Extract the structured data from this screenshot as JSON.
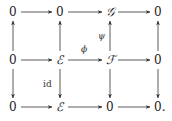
{
  "diagram": {
    "nodes": [
      {
        "id": "r1c1",
        "text": "0",
        "row": 0,
        "col": 0
      },
      {
        "id": "r1c2",
        "text": "0",
        "row": 0,
        "col": 1
      },
      {
        "id": "r1c3",
        "text": "𝒢",
        "row": 0,
        "col": 2
      },
      {
        "id": "r1c4",
        "text": "0",
        "row": 0,
        "col": 3
      },
      {
        "id": "r2c1",
        "text": "0",
        "row": 1,
        "col": 0
      },
      {
        "id": "r2c2",
        "text": "ℰ",
        "row": 1,
        "col": 1
      },
      {
        "id": "r2c3",
        "text": "ℱ",
        "row": 1,
        "col": 2
      },
      {
        "id": "r2c4",
        "text": "0",
        "row": 1,
        "col": 3
      },
      {
        "id": "r3c1",
        "text": "0",
        "row": 2,
        "col": 0
      },
      {
        "id": "r3c2",
        "text": "ℰ",
        "row": 2,
        "col": 1
      },
      {
        "id": "r3c3",
        "text": "0",
        "row": 2,
        "col": 2
      },
      {
        "id": "r3c4",
        "text": "0.",
        "row": 2,
        "col": 3
      }
    ],
    "arrows": [
      {
        "from": "r1c1",
        "to": "r1c2",
        "label": ""
      },
      {
        "from": "r1c2",
        "to": "r1c3",
        "label": ""
      },
      {
        "from": "r1c3",
        "to": "r1c4",
        "label": ""
      },
      {
        "from": "r2c1",
        "to": "r2c2",
        "label": ""
      },
      {
        "from": "r2c2",
        "to": "r2c3",
        "label": "ϕ"
      },
      {
        "from": "r2c3",
        "to": "r2c4",
        "label": ""
      },
      {
        "from": "r3c1",
        "to": "r3c2",
        "label": ""
      },
      {
        "from": "r3c2",
        "to": "r3c3",
        "label": ""
      },
      {
        "from": "r3c3",
        "to": "r3c4",
        "label": ""
      },
      {
        "from": "r2c1",
        "to": "r1c1",
        "label": ""
      },
      {
        "from": "r2c2",
        "to": "r1c2",
        "label": ""
      },
      {
        "from": "r2c3",
        "to": "r1c3",
        "label": "ψ"
      },
      {
        "from": "r2c4",
        "to": "r1c4",
        "label": ""
      },
      {
        "from": "r2c1",
        "to": "r3c1",
        "label": ""
      },
      {
        "from": "r2c2",
        "to": "r3c2",
        "label": "id"
      },
      {
        "from": "r2c3",
        "to": "r3c3",
        "label": ""
      },
      {
        "from": "r2c4",
        "to": "r3c4",
        "label": ""
      }
    ]
  }
}
